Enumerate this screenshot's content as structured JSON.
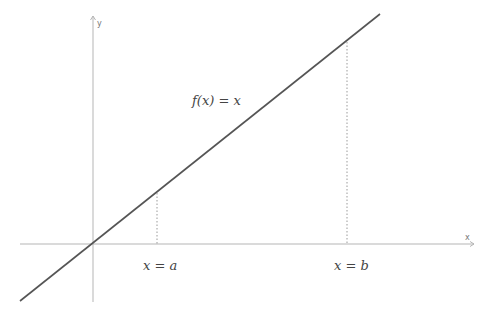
{
  "diagram": {
    "function_label": "f(x) = x",
    "x_axis_label": "x",
    "y_axis_label": "y",
    "marker_a_label": "x = a",
    "marker_b_label": "x = b"
  },
  "colors": {
    "axis": "#b5b5b5",
    "function_line": "#555555",
    "dashed": "#9a9a9a",
    "text": "#444444"
  }
}
